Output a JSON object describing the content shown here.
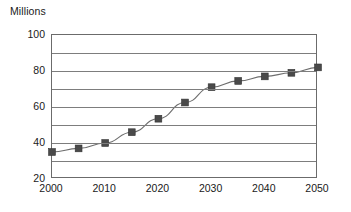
{
  "chart_data": {
    "type": "line",
    "title": "Millions",
    "xlabel": "",
    "ylabel": "Millions",
    "x": [
      2000,
      2005,
      2010,
      2015,
      2020,
      2025,
      2030,
      2035,
      2040,
      2045,
      2050
    ],
    "values": [
      35,
      37,
      40,
      46,
      53.5,
      62.5,
      71,
      74.5,
      77,
      79,
      82
    ],
    "series": [
      {
        "name": "Population",
        "values": [
          35,
          37,
          40,
          46,
          53.5,
          62.5,
          71,
          74.5,
          77,
          79,
          82
        ]
      }
    ],
    "xlim": [
      2000,
      2050
    ],
    "ylim": [
      20,
      100
    ],
    "x_tick_labels": [
      "2000",
      "2010",
      "2020",
      "2030",
      "2040",
      "2050"
    ],
    "x_ticks": [
      2000,
      2010,
      2020,
      2030,
      2040,
      2050
    ],
    "y_tick_labels": [
      "100",
      "80",
      "60",
      "40",
      "20"
    ],
    "y_ticks": [
      100,
      80,
      60,
      40,
      20
    ],
    "gridlines_y": [
      100,
      90,
      80,
      70,
      60,
      50,
      40,
      30,
      20
    ],
    "grid": true,
    "legend": "none",
    "marker_style": "square",
    "colors": {
      "marker": "#4a4a4a",
      "line": "#6e6e6e",
      "grid": "#7d7d7d",
      "frame": "#6b6b6b",
      "text": "#1a1a1a",
      "background": "#ffffff"
    }
  }
}
